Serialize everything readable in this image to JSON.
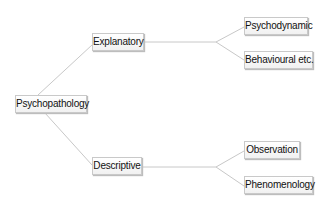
{
  "diagram": {
    "type": "tree",
    "root": {
      "label": "Psychopathology"
    },
    "branches": [
      {
        "label": "Explanatory",
        "children": [
          {
            "label": "Psychodynamic"
          },
          {
            "label": "Behavioural etc."
          }
        ]
      },
      {
        "label": "Descriptive",
        "children": [
          {
            "label": "Observation"
          },
          {
            "label": "Phenomenology"
          }
        ]
      }
    ],
    "colors": {
      "line": "#c8c8c8",
      "box_border": "#c9c9c9",
      "text": "#111111"
    }
  }
}
